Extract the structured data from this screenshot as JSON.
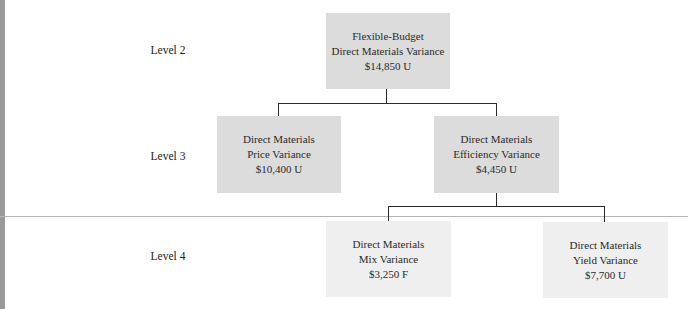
{
  "diagram": {
    "levels": [
      {
        "label": "Level 2"
      },
      {
        "label": "Level 3"
      },
      {
        "label": "Level 4"
      }
    ],
    "nodes": {
      "flexible_budget": {
        "line1": "Flexible-Budget",
        "line2": "Direct Materials Variance",
        "amount": "$14,850 U"
      },
      "price": {
        "line1": "Direct Materials",
        "line2": "Price Variance",
        "amount": "$10,400 U"
      },
      "efficiency": {
        "line1": "Direct Materials",
        "line2": "Efficiency Variance",
        "amount": "$4,450 U"
      },
      "mix": {
        "line1": "Direct Materials",
        "line2": "Mix Variance",
        "amount": "$3,250 F"
      },
      "yield": {
        "line1": "Direct Materials",
        "line2": "Yield Variance",
        "amount": "$7,700 U"
      }
    },
    "edges": [
      {
        "from": "flexible_budget",
        "to": "price"
      },
      {
        "from": "flexible_budget",
        "to": "efficiency"
      },
      {
        "from": "efficiency",
        "to": "mix"
      },
      {
        "from": "efficiency",
        "to": "yield"
      }
    ],
    "colors": {
      "level_2_3_fill": "#dcdcdc",
      "level_4_fill": "#efefef",
      "connector": "#2b2b2b"
    }
  }
}
